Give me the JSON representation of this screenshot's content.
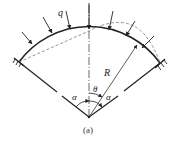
{
  "figure": {
    "caption": "(a)",
    "labels": {
      "load": "q",
      "radius": "R",
      "angle_theta": "θ",
      "angle_alpha_left": "α",
      "angle_alpha_right": "α"
    },
    "colors": {
      "line": "#222222",
      "dashed": "#777777",
      "background": "#ffffff"
    }
  }
}
